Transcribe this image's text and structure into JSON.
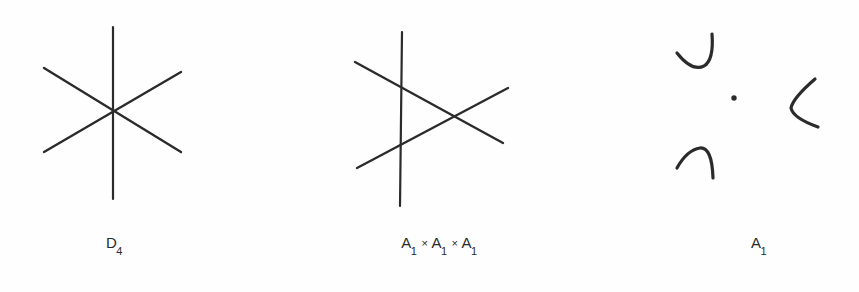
{
  "page": {
    "background_color": "#fefefe",
    "ink_color": "#2b2b2b",
    "width": 859,
    "height": 292
  },
  "figures": [
    {
      "id": "d4",
      "caption_main": "D",
      "caption_sub": "4",
      "caption_plain": "D4",
      "drawing_type": "three-concurrent-lines",
      "description": "six-pointed asterisk: three straight lines meeting at one common center",
      "center": [
        113,
        112
      ],
      "lines": [
        {
          "name": "vertical-line",
          "x1": 113,
          "y1": 27,
          "x2": 113,
          "y2": 199
        },
        {
          "name": "diagonal-line-up",
          "x1": 44,
          "y1": 152,
          "x2": 181,
          "y2": 72
        },
        {
          "name": "diagonal-line-down",
          "x1": 44,
          "y1": 68,
          "x2": 181,
          "y2": 152
        }
      ]
    },
    {
      "id": "a1a1a1",
      "caption_main": "A",
      "caption_sub": "1",
      "caption_plain": "A1 x A1 x A1",
      "caption_parts": [
        "A",
        "1",
        "×",
        "A",
        "1",
        "×",
        "A",
        "1"
      ],
      "separator": "×",
      "drawing_type": "three-lines-generic-triangle",
      "description": "three straight lines in general position forming a small central triangle",
      "lines": [
        {
          "name": "vertical-line",
          "x1": 402,
          "y1": 32,
          "x2": 400,
          "y2": 206
        },
        {
          "name": "diagonal-line-down",
          "x1": 355,
          "y1": 62,
          "x2": 503,
          "y2": 143
        },
        {
          "name": "diagonal-line-up",
          "x1": 357,
          "y1": 168,
          "x2": 508,
          "y2": 88
        }
      ]
    },
    {
      "id": "a1",
      "caption_main": "A",
      "caption_sub": "1",
      "caption_plain": "A1",
      "drawing_type": "three-arcs-and-dot",
      "description": "three short curved arc strokes arranged around a single small dot",
      "marks": [
        {
          "name": "arc-upper-left",
          "shape": "hook-opening-up-left"
        },
        {
          "name": "arc-lower-left",
          "shape": "arch-opening-down-right"
        },
        {
          "name": "arc-right",
          "shape": "chevron-opening-right"
        },
        {
          "name": "center-dot",
          "shape": "dot",
          "cx": 734,
          "cy": 98,
          "r": 2.6
        }
      ]
    }
  ]
}
